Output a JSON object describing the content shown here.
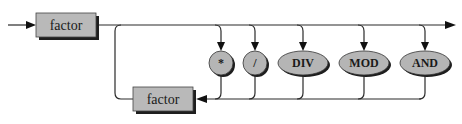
{
  "diagram": {
    "type": "syntax-diagram",
    "rule": "term",
    "nonterminals": [
      {
        "id": "factor-main",
        "label": "factor"
      },
      {
        "id": "factor-loop",
        "label": "factor"
      }
    ],
    "operators": [
      {
        "id": "op-mul",
        "label": "*"
      },
      {
        "id": "op-div-slash",
        "label": "/"
      },
      {
        "id": "op-div",
        "label": "DIV"
      },
      {
        "id": "op-mod",
        "label": "MOD"
      },
      {
        "id": "op-and",
        "label": "AND"
      }
    ],
    "colors": {
      "box_fill": "#b9b9b9",
      "oval_fill": "#b5b5b5",
      "shadow": "#1e1e1e",
      "line": "#2a2a2a"
    }
  }
}
